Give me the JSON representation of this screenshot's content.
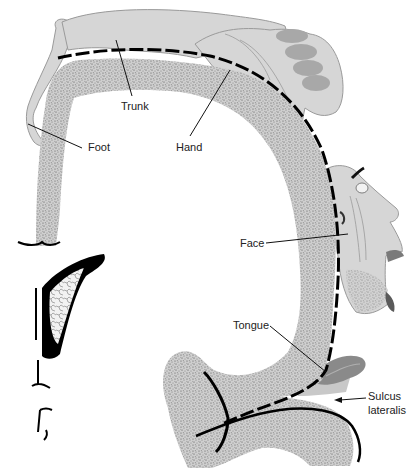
{
  "diagram": {
    "type": "motor-homunculus-coronal-section",
    "labels": {
      "trunk": "Trunk",
      "foot": "Foot",
      "hand": "Hand",
      "face": "Face",
      "tongue": "Tongue",
      "sulcus_line1": "Sulcus",
      "sulcus_line2": "lateralis"
    },
    "colors": {
      "background": "#ffffff",
      "body_fill": "#d6d6d6",
      "body_outline": "#9a9a9a",
      "fingertip_fill": "#a8a8a8",
      "cortex_fill": "#c4c4c4",
      "cortex_speckle": "#5a5a5a",
      "sulcus_line": "#000000",
      "tongue_fill": "#8a8a8a",
      "label_text": "#222222"
    }
  }
}
